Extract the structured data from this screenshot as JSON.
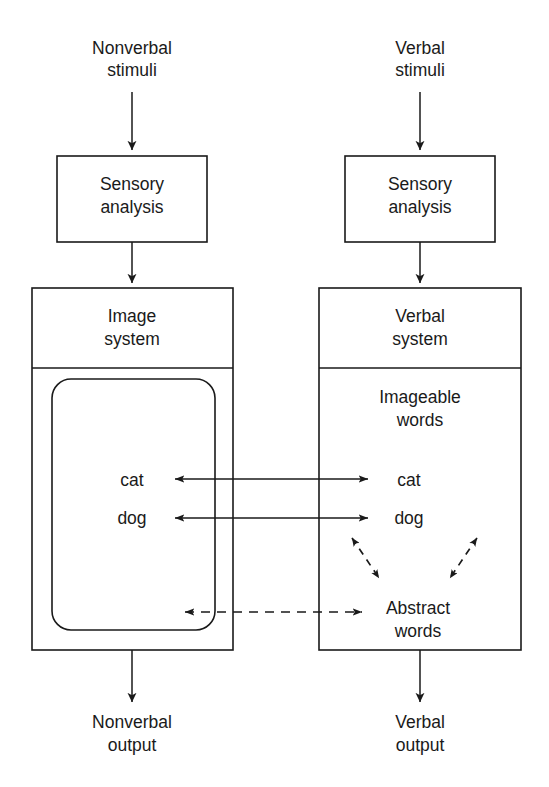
{
  "diagram": {
    "stroke_color": "#1a1a1a",
    "background_color": "#ffffff",
    "columns": [
      {
        "id": "nonverbal",
        "input_label_line1": "Nonverbal",
        "input_label_line2": "stimuli",
        "sensory_label_line1": "Sensory",
        "sensory_label_line2": "analysis",
        "system_label_line1": "Image",
        "system_label_line2": "system",
        "output_label_line1": "Nonverbal",
        "output_label_line2": "output"
      },
      {
        "id": "verbal",
        "input_label_line1": "Verbal",
        "input_label_line2": "stimuli",
        "sensory_label_line1": "Sensory",
        "sensory_label_line2": "analysis",
        "system_label_line1": "Verbal",
        "system_label_line2": "system",
        "output_label_line1": "Verbal",
        "output_label_line2": "output"
      }
    ],
    "verbal_subsection": {
      "imageable_line1": "Imageable",
      "imageable_line2": "words",
      "abstract_line1": "Abstract",
      "abstract_line2": "words"
    },
    "items": {
      "left_word_1": "cat",
      "left_word_2": "dog",
      "right_word_1": "cat",
      "right_word_2": "dog"
    },
    "connections": [
      {
        "id": "cat-link",
        "label": "cat",
        "style": "solid",
        "heads": "both"
      },
      {
        "id": "dog-link",
        "label": "dog",
        "style": "solid",
        "heads": "both"
      },
      {
        "id": "abstract-link",
        "label": "Abstract words",
        "style": "dashed",
        "heads": "both"
      },
      {
        "id": "abstract-to-imageable-left",
        "label": "",
        "style": "dashed",
        "heads": "both"
      },
      {
        "id": "abstract-to-imageable-right",
        "label": "",
        "style": "dashed",
        "heads": "both"
      }
    ]
  }
}
